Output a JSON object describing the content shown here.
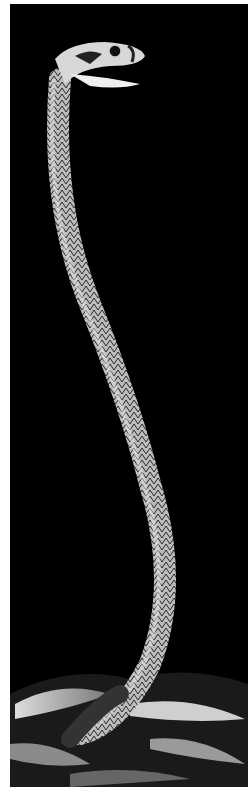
{
  "image": {
    "subject": "snake rearing upright",
    "background_color": "#000000",
    "border_color": "#ffffff",
    "style": "black-and-white photograph"
  }
}
